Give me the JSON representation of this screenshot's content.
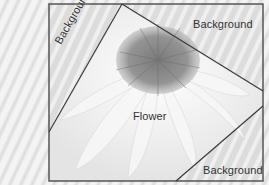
{
  "diagram": {
    "regions": [
      {
        "id": "background-left",
        "label": "Background"
      },
      {
        "id": "background-top-right",
        "label": "Background"
      },
      {
        "id": "flower",
        "label": "Flower"
      },
      {
        "id": "background-bottom-right",
        "label": "Background"
      }
    ],
    "colors": {
      "frame": "#555555",
      "lines": "#3a3a3a",
      "text": "#333333",
      "flower_center": "#8a8a8a",
      "petals": "#f2f2f2",
      "background": "#d9d9d9"
    }
  }
}
